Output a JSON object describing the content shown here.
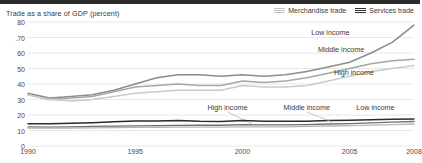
{
  "chart_data": {
    "type": "line",
    "title": "Trade as a share of GDP (percent)",
    "xlabel": "",
    "ylabel": "Trade as a share of GDP (percent)",
    "xlim": [
      1990,
      2008
    ],
    "ylim": [
      0,
      80
    ],
    "grid": true,
    "legend_position": "top-right",
    "yticks": [
      80,
      70,
      60,
      50,
      40,
      30,
      20,
      10,
      0
    ],
    "ytick_labels": [
      "80",
      ".70",
      "60",
      "50",
      "40",
      "30",
      "20",
      "10",
      "0"
    ],
    "xticks": [
      1990,
      1995,
      2000,
      2005,
      2008
    ],
    "xtick_labels": [
      "1990",
      "1995",
      "2000",
      "2005",
      "2008"
    ],
    "legend": [
      {
        "name": "Merchandise trade",
        "color": "#b9b9b9"
      },
      {
        "name": "Services trade",
        "color": "#2e2e2e"
      }
    ],
    "x": [
      1990,
      1991,
      1992,
      1993,
      1994,
      1995,
      1996,
      1997,
      1998,
      1999,
      2000,
      2001,
      2002,
      2003,
      2004,
      2005,
      2006,
      2007,
      2008
    ],
    "series": [
      {
        "name": "Low income",
        "group": "Merchandise trade",
        "color": "#8c8c8c",
        "width": 1.5,
        "label": "Low income",
        "label_x": 2004.1,
        "label_y": 73.5,
        "values": [
          34,
          31,
          32,
          33,
          36,
          40,
          44,
          46,
          46,
          45,
          46,
          45,
          46,
          48,
          51,
          54,
          60,
          67,
          78
        ]
      },
      {
        "name": "Middle income",
        "group": "Merchandise trade",
        "color": "#a6a6a6",
        "width": 1.5,
        "label": "Middle income",
        "label_x": 2004.6,
        "label_y": 62.5,
        "values": [
          33,
          30,
          31,
          32,
          35,
          38,
          39,
          40,
          39,
          39,
          42,
          41,
          42,
          44,
          47,
          50,
          53,
          55,
          56
        ]
      },
      {
        "name": "High income",
        "group": "Merchandise trade",
        "color": "#cacaca",
        "width": 1.5,
        "label": "High income",
        "label_x": 2005.2,
        "label_y": 48.0,
        "values": [
          33,
          30,
          29,
          30,
          32,
          34,
          35,
          36,
          36,
          36,
          39,
          38,
          38,
          39,
          42,
          45,
          48,
          50,
          52
        ]
      },
      {
        "name": "High income",
        "group": "Services trade",
        "color": "#6f6f6f",
        "width": 1.3,
        "label": "High income",
        "label_x": 1999.3,
        "label_y": 25.0,
        "leader": {
          "x1": 1999.3,
          "y1": 22.0,
          "x2": 2000.6,
          "y2": 13.2
        },
        "values": [
          12.3,
          12.2,
          12.4,
          12.6,
          12.8,
          13.0,
          13.1,
          13.3,
          13.4,
          13.4,
          13.8,
          13.6,
          13.6,
          13.8,
          14.2,
          14.5,
          14.9,
          15.4,
          15.8
        ]
      },
      {
        "name": "Middle income",
        "group": "Services trade",
        "color": "#2b2b2b",
        "width": 1.5,
        "label": "Middle income",
        "label_x": 2003.0,
        "label_y": 25.0,
        "leader": {
          "x1": 2003.0,
          "y1": 22.0,
          "x2": 2004.2,
          "y2": 15.4
        },
        "values": [
          14.3,
          14.3,
          14.6,
          15.0,
          15.6,
          16.1,
          16.2,
          16.4,
          15.9,
          15.8,
          16.4,
          16.0,
          15.9,
          16.0,
          16.4,
          16.6,
          16.9,
          17.2,
          17.4
        ]
      },
      {
        "name": "Low income",
        "group": "Services trade",
        "color": "#b5b5b5",
        "width": 1.3,
        "label": "Low income",
        "label_x": 2006.2,
        "label_y": 25.0,
        "values": [
          11.6,
          11.5,
          11.6,
          11.7,
          11.8,
          12.0,
          12.1,
          12.2,
          12.2,
          12.2,
          12.4,
          12.3,
          12.4,
          12.6,
          12.9,
          13.2,
          13.5,
          13.8,
          14.2
        ]
      }
    ]
  }
}
